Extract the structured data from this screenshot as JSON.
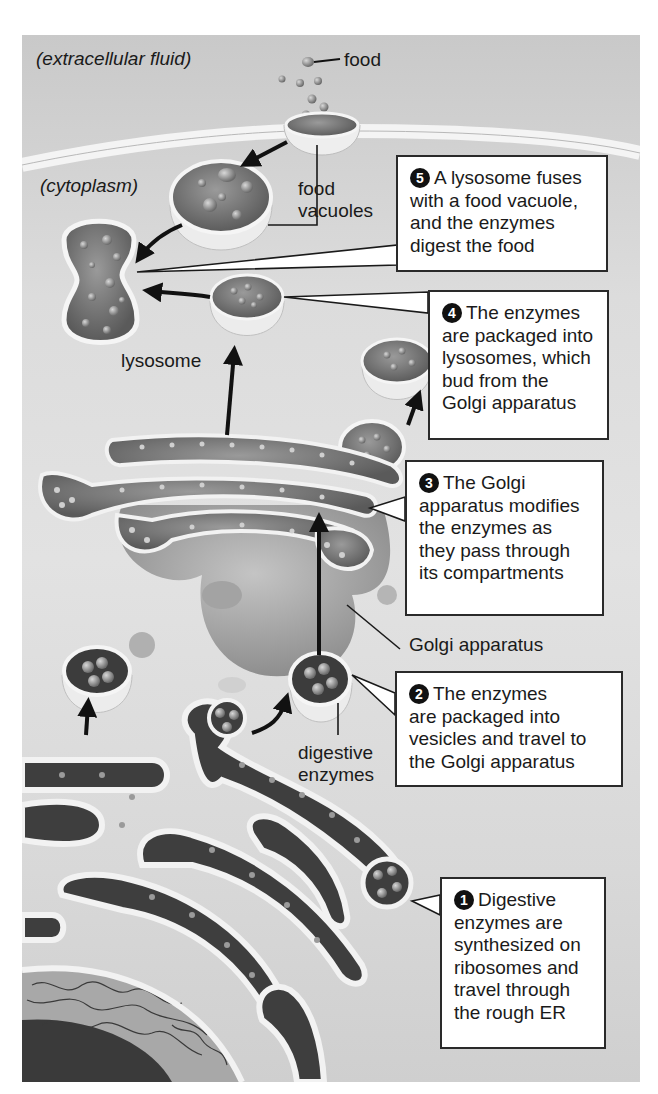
{
  "labels": {
    "extracellular": "(extracellular fluid)",
    "cytoplasm": "(cytoplasm)",
    "food": "food",
    "food_vacuoles_1": "food",
    "food_vacuoles_2": "vacuoles",
    "lysosome": "lysosome",
    "golgi": "Golgi apparatus",
    "digestive_1": "digestive",
    "digestive_2": "enzymes"
  },
  "steps": [
    {
      "number": "1",
      "lines": [
        "Digestive",
        "enzymes are",
        "synthesized on",
        "ribosomes and",
        "travel through",
        "the rough ER"
      ]
    },
    {
      "number": "2",
      "lines": [
        "The enzymes",
        "are packaged into",
        "vesicles and travel to",
        "the Golgi apparatus"
      ]
    },
    {
      "number": "3",
      "lines": [
        "The Golgi",
        "apparatus modifies",
        "the enzymes as",
        "they pass through",
        "its compartments"
      ]
    },
    {
      "number": "4",
      "lines": [
        "The enzymes",
        "are packaged into",
        "lysosomes, which",
        "bud from the",
        "Golgi apparatus"
      ]
    },
    {
      "number": "5",
      "lines": [
        "A lysosome fuses",
        "with a food vacuole,",
        "and the enzymes",
        "digest the food"
      ]
    }
  ],
  "colors": {
    "background": "#dcdcdc",
    "membrane": "#f2f2f2",
    "lumen": "#6f6f6f",
    "particle": "#8a8a8a",
    "arrow": "#111111",
    "box_border": "#2a2a2a"
  }
}
